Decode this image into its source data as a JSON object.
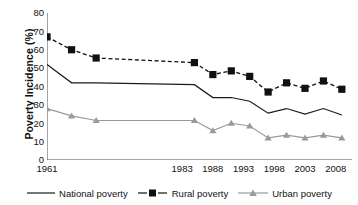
{
  "chart_data": {
    "type": "line",
    "title": "",
    "xlabel": "",
    "ylabel": "Poverty Incidence (%)",
    "ylim": [
      0,
      80
    ],
    "ytick_step": 10,
    "yticks": [
      "0",
      "10",
      "20",
      "30",
      "40",
      "50",
      "60",
      "70",
      "80"
    ],
    "xlim": [
      1961,
      2010
    ],
    "xticks": [
      "1961",
      "1983",
      "1988",
      "1993",
      "1998",
      "2003",
      "2008"
    ],
    "xtick_values": [
      1961,
      1983,
      1988,
      1993,
      1998,
      2003,
      2008
    ],
    "minor_tick_count": 25,
    "grid": false,
    "legend_position": "bottom",
    "x": [
      1961,
      1965,
      1969,
      1985,
      1988,
      1991,
      1994,
      1997,
      2000,
      2003,
      2006,
      2009
    ],
    "series": [
      {
        "name": "National poverty",
        "marker": "none",
        "linestyle": "solid",
        "color": "#1a1a1a",
        "values": [
          52.0,
          42.0,
          42.0,
          41.0,
          34.0,
          34.0,
          32.0,
          25.5,
          28.0,
          25.0,
          28.0,
          24.5
        ]
      },
      {
        "name": "Rural poverty",
        "marker": "square",
        "linestyle": "dashed",
        "color": "#111111",
        "values": [
          67.0,
          60.0,
          55.5,
          53.0,
          46.5,
          48.5,
          45.5,
          37.0,
          42.0,
          39.0,
          43.0,
          38.5
        ]
      },
      {
        "name": "Urban poverty",
        "marker": "triangle",
        "linestyle": "solid",
        "color": "#9a9a9a",
        "values": [
          28.0,
          24.0,
          21.5,
          21.5,
          16.0,
          20.0,
          18.5,
          12.0,
          13.5,
          12.0,
          13.5,
          12.0
        ]
      }
    ]
  },
  "legend": {
    "items": [
      {
        "label": "National poverty"
      },
      {
        "label": "Rural poverty"
      },
      {
        "label": "Urban poverty"
      }
    ]
  },
  "colors": {
    "axis": "#4d4d4d",
    "national": "#1a1a1a",
    "rural": "#111111",
    "urban": "#9a9a9a",
    "background": "#ffffff"
  }
}
